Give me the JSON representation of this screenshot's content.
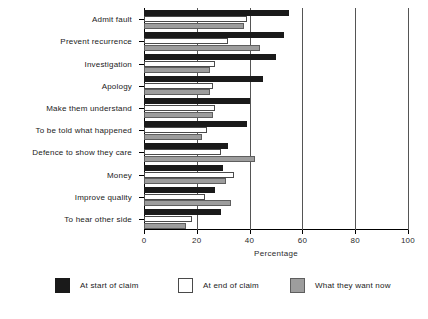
{
  "chart_data": {
    "type": "bar",
    "orientation": "horizontal",
    "title": "",
    "xlabel": "Percentage",
    "ylabel": "",
    "xlim": [
      0,
      100
    ],
    "xticks": [
      0,
      20,
      40,
      60,
      80,
      100
    ],
    "xtick_labels": [
      "0",
      "20",
      "40",
      "60",
      "80",
      "100"
    ],
    "grid": true,
    "grid_axis": "x",
    "legend_position": "bottom",
    "categories": [
      "Admit fault",
      "Prevent recurrence",
      "Investigation",
      "Apology",
      "Make them understand",
      "To be told what happened",
      "Defence to show they care",
      "Money",
      "Improve quality",
      "To hear other side"
    ],
    "series": [
      {
        "name": "At start of claim",
        "color": "#1a1a1a",
        "values": [
          55,
          53,
          50,
          45,
          40,
          39,
          32,
          30,
          27,
          29
        ]
      },
      {
        "name": "At end of claim",
        "color": "#ffffff",
        "values": [
          39,
          32,
          27,
          26,
          27,
          24,
          29,
          34,
          23,
          18
        ]
      },
      {
        "name": "What they want now",
        "color": "#9d9d9d",
        "values": [
          38,
          44,
          25,
          25,
          26,
          22,
          42,
          31,
          33,
          16
        ]
      }
    ]
  },
  "axis": {
    "x_title": "Percentage"
  },
  "legend": {
    "items": [
      {
        "label": "At start of claim",
        "key": "start"
      },
      {
        "label": "At end of claim",
        "key": "end"
      },
      {
        "label": "What they want now",
        "key": "now"
      }
    ]
  }
}
